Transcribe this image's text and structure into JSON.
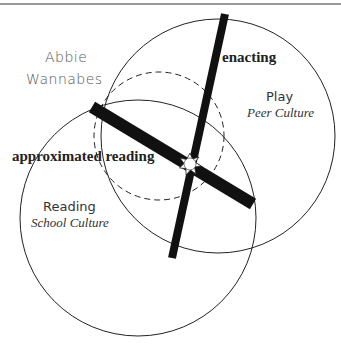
{
  "diagram": {
    "group_label_line1": "Abbie",
    "group_label_line2": "Wannabes",
    "axis_vertical_label": "enacting",
    "axis_horizontal_label": "approximated reading",
    "circles": [
      {
        "title": "Play",
        "subtitle": "Peer Culture"
      },
      {
        "title": "Reading",
        "subtitle": "School Culture"
      }
    ],
    "colors": {
      "stroke": "#222222",
      "bar": "#111111",
      "rule": "#777777"
    }
  }
}
